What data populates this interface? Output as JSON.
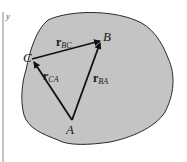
{
  "figure": {
    "axis_label": "y",
    "points": {
      "A": {
        "label": "A",
        "x": 72,
        "y": 120
      },
      "B": {
        "label": "B",
        "x": 101,
        "y": 41
      },
      "C": {
        "label": "C",
        "x": 32,
        "y": 59
      }
    },
    "vectors": [
      {
        "name": "r",
        "sub": "BC",
        "from": "C",
        "to": "B"
      },
      {
        "name": "r",
        "sub": "CA",
        "from": "A",
        "to": "C"
      },
      {
        "name": "r",
        "sub": "BA",
        "from": "A",
        "to": "B"
      }
    ],
    "colors": {
      "body_fill": "#c4c4c4",
      "outline": "#2a2a2a",
      "vector": "#111111",
      "axis": "#888888"
    }
  }
}
